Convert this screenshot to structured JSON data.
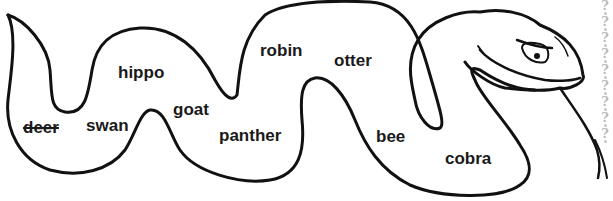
{
  "worksheet": {
    "title": "Snake word puzzle",
    "words": [
      {
        "id": "deer",
        "text": "deer",
        "crossed_out": true
      },
      {
        "id": "swan",
        "text": "swan",
        "crossed_out": false
      },
      {
        "id": "hippo",
        "text": "hippo",
        "crossed_out": false
      },
      {
        "id": "goat",
        "text": "goat",
        "crossed_out": false
      },
      {
        "id": "panther",
        "text": "panther",
        "crossed_out": false
      },
      {
        "id": "robin",
        "text": "robin",
        "crossed_out": false
      },
      {
        "id": "otter",
        "text": "otter",
        "crossed_out": false
      },
      {
        "id": "bee",
        "text": "bee",
        "crossed_out": false
      },
      {
        "id": "cobra",
        "text": "cobra",
        "crossed_out": false
      }
    ],
    "border_glyph": "?",
    "colors": {
      "outline": "#111111",
      "text": "#1a1a1a",
      "border": "#bbbbbb"
    }
  }
}
